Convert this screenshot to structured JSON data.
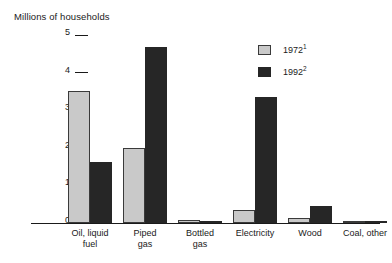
{
  "chart_data": {
    "type": "bar",
    "title": "Millions of households",
    "xlabel": "",
    "ylabel": "Millions of households",
    "ylim": [
      0,
      5
    ],
    "yticks": [
      0,
      1,
      2,
      3,
      4,
      5
    ],
    "ytick_labels": [
      "0",
      "1",
      "2",
      "3",
      "4",
      "5"
    ],
    "grid": false,
    "legend_position": "top-right",
    "categories": [
      "Oil, liquid\nfuel",
      "Piped\ngas",
      "Bottled\ngas",
      "Electricity",
      "Wood",
      "Coal, other"
    ],
    "series": [
      {
        "name": "1972",
        "footnote": "1",
        "color": "#c9c9c9",
        "border_color": "#3a3a3a",
        "values": [
          3.5,
          2.0,
          0.07,
          0.35,
          0.13,
          0.03
        ]
      },
      {
        "name": "1992",
        "footnote": "2",
        "color": "#262626",
        "border_color": "#262626",
        "values": [
          1.62,
          4.68,
          0.06,
          3.35,
          0.45,
          0.03
        ]
      }
    ]
  },
  "legend": {
    "items": [
      {
        "label": "1972",
        "sup": "1"
      },
      {
        "label": "1992",
        "sup": "2"
      }
    ]
  }
}
